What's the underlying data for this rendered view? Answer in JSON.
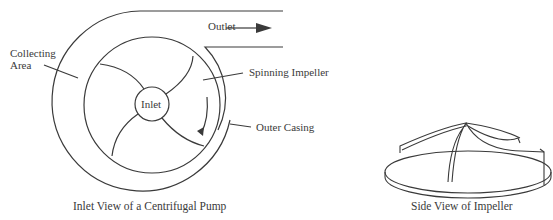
{
  "pump_diagram": {
    "labels": {
      "outlet": "Outlet",
      "collecting_area_line1": "Collecting",
      "collecting_area_line2": "Area",
      "spinning_impeller": "Spinning Impeller",
      "inlet": "Inlet",
      "outer_casing": "Outer Casing"
    },
    "caption": "Inlet View of a Centrifugal Pump"
  },
  "impeller_diagram": {
    "caption": "Side View of Impeller"
  },
  "colors": {
    "line": "#3a3a3a",
    "background": "#ffffff"
  }
}
